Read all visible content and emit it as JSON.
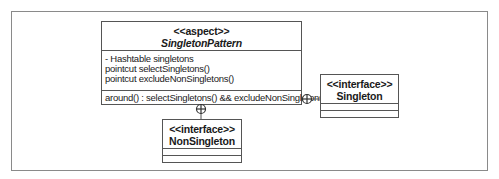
{
  "diagram": {
    "type": "UML class diagram",
    "classes": {
      "aspect": {
        "stereotype": "<<aspect>>",
        "name": "SingletonPattern",
        "attributes": [
          "- Hashtable singletons",
          "pointcut selectSingletons()",
          "pointcut excludeNonSingletons()"
        ],
        "operations": [
          "around() : selectSingletons() && excludeNonSingletons()"
        ]
      },
      "singleton": {
        "stereotype": "<<interface>>",
        "name": "Singleton"
      },
      "nonsingleton": {
        "stereotype": "<<interface>>",
        "name": "NonSingleton"
      }
    },
    "relationships": [
      {
        "from": "SingletonPattern",
        "to": "Singleton",
        "type": "containment",
        "icon": "circle-plus-icon"
      },
      {
        "from": "SingletonPattern",
        "to": "NonSingleton",
        "type": "containment",
        "icon": "circle-plus-icon"
      }
    ],
    "colors": {
      "line": "#555555",
      "frame": "#8a8a8a",
      "text": "#1a1a1a",
      "background": "#ffffff"
    }
  }
}
